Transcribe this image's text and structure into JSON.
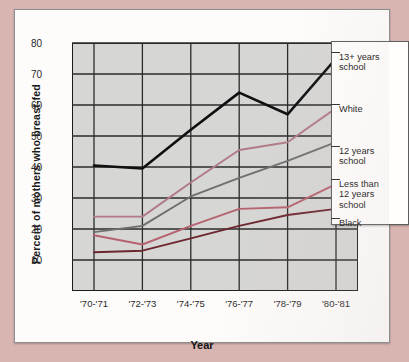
{
  "chart_data": {
    "type": "line",
    "title": "",
    "xlabel": "Year",
    "ylabel": "Percent of mothers who breast-fed",
    "categories": [
      "'70-'71",
      "'72-'73",
      "'74-'75",
      "'76-'77",
      "'78-'79",
      "'80-'81"
    ],
    "ylim": [
      0,
      80
    ],
    "yticks": [
      10,
      20,
      30,
      40,
      50,
      60,
      70,
      80
    ],
    "grid": true,
    "legend_position": "right-overlay",
    "series": [
      {
        "name": "13+ years school",
        "color": "#101010",
        "values": [
          40.5,
          39.5,
          52.0,
          64.0,
          57.0,
          75.0
        ]
      },
      {
        "name": "White",
        "color": "#b07b86",
        "values": [
          24.0,
          24.0,
          35.0,
          45.5,
          48.0,
          59.0
        ]
      },
      {
        "name": "12 years school",
        "color": "#6f6f6f",
        "values": [
          19.0,
          21.0,
          30.5,
          36.5,
          42.0,
          48.0
        ]
      },
      {
        "name": "Less than 12 years school",
        "color": "#b5636f",
        "values": [
          18.0,
          15.0,
          21.0,
          26.5,
          27.0,
          34.5
        ]
      },
      {
        "name": "Black",
        "color": "#6d2630",
        "values": [
          12.5,
          13.0,
          17.0,
          21.0,
          24.5,
          26.5
        ]
      }
    ]
  },
  "legend": {
    "entries": [
      {
        "label_line1": "13+ years",
        "label_line2": "school"
      },
      {
        "label_line1": "White",
        "label_line2": ""
      },
      {
        "label_line1": "12 years",
        "label_line2": "school"
      },
      {
        "label_line1": "Less than",
        "label_line2": "12 years",
        "label_line3": "school"
      },
      {
        "label_line1": "Black",
        "label_line2": ""
      }
    ]
  },
  "colors": {
    "page_background": "#d9b5b2",
    "card_background": "#fdfcfb",
    "plot_background": "#d6d6d4",
    "grid": "#2b2b2b",
    "axis": "#1c1c1c"
  }
}
